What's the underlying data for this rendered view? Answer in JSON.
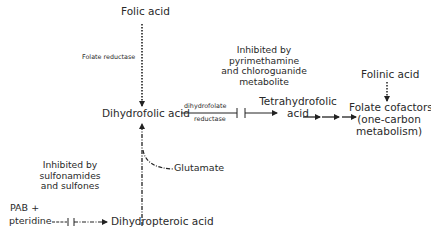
{
  "diagram": {
    "nodes": {
      "folic_acid": "Folic acid",
      "dihydrofolic_acid": "Dihydrofolic acid",
      "tetrahydrofolic_acid_line1": "Tetrahydrofolic",
      "tetrahydrofolic_acid_line2": "acid",
      "folinic_acid": "Folinic acid",
      "folate_cofactors_line1": "Folate cofactors",
      "folate_cofactors_line2": "(one-carbon",
      "folate_cofactors_line3": "metabolism)",
      "glutamate": "Glutamate",
      "pab_line1": "PAB +",
      "pab_line2": "pteridine",
      "dihydropteroic_acid": "Dihydropteroic acid"
    },
    "enzymes": {
      "folate_reductase": "Folate reductase",
      "dhfr_line1": "dihydrofolate",
      "dhfr_line2": "reductase"
    },
    "annotations": {
      "pyrimethamine": [
        "Inhibited by",
        "pyrimethamine",
        "and chloroguanide",
        "metabolite"
      ],
      "sulfonamides": [
        "Inhibited by",
        "sulfonamides",
        "and sulfones"
      ]
    }
  }
}
